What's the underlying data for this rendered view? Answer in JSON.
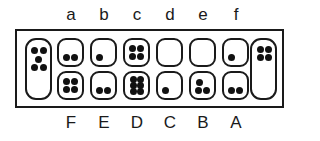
{
  "game": "Mancala (Kalah) board position",
  "colors": {
    "line": "#1a1a1a",
    "stone": "#111111",
    "background": "#ffffff"
  },
  "top_row": {
    "labels": [
      "a",
      "b",
      "c",
      "d",
      "e",
      "f"
    ],
    "stones": [
      2,
      1,
      4,
      0,
      0,
      1
    ]
  },
  "bottom_row": {
    "labels": [
      "F",
      "E",
      "D",
      "C",
      "B",
      "A"
    ],
    "stones": [
      4,
      2,
      6,
      1,
      3,
      2
    ]
  },
  "stores": {
    "left": {
      "stones": 5
    },
    "right": {
      "stones": 4
    }
  }
}
